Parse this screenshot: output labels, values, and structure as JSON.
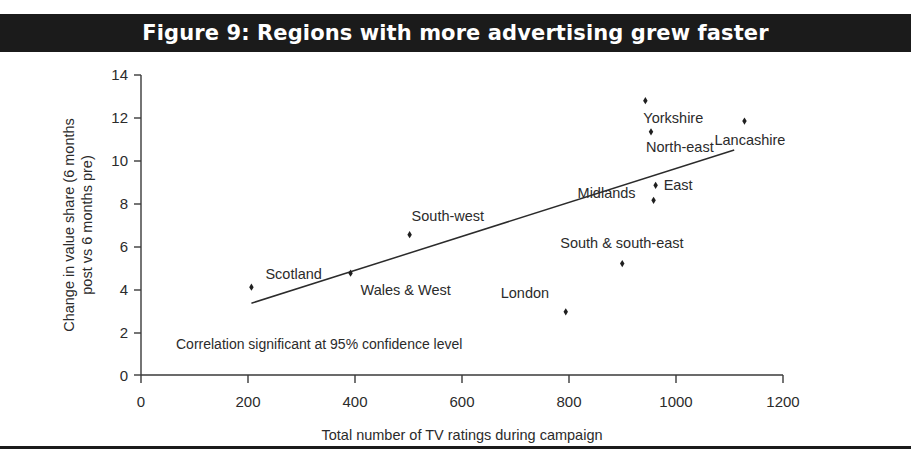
{
  "figure": {
    "title": "Figure 9: Regions with more advertising grew faster",
    "banner_color": "#1b1b1b",
    "banner_text_color": "#ffffff"
  },
  "chart_data": {
    "type": "scatter",
    "title": "Figure 9: Regions with more advertising grew faster",
    "xlabel": "Total number of TV ratings during campaign",
    "ylabel": "Change in value share (6 months post vs 6 months pre)",
    "ylabel_line1": "Change in value share (6 months",
    "ylabel_line2": "post vs 6 months pre)",
    "xlim": [
      0,
      1250
    ],
    "ylim": [
      0,
      14
    ],
    "xticks": [
      0,
      200,
      400,
      600,
      800,
      1000,
      1200
    ],
    "yticks": [
      0,
      2,
      4,
      6,
      8,
      10,
      12,
      14
    ],
    "grid": false,
    "legend": "none",
    "marker_color": "#1f1f1f",
    "points": [
      {
        "label": "Scotland",
        "x": 215,
        "y": 4.1,
        "label_dx": 14,
        "label_dy": -8
      },
      {
        "label": "Wales & West",
        "x": 408,
        "y": 4.75,
        "label_dx": 10,
        "label_dy": 22
      },
      {
        "label": "South-west",
        "x": 523,
        "y": 6.55,
        "label_dx": 2,
        "label_dy": -14
      },
      {
        "label": "London",
        "x": 827,
        "y": 2.95,
        "label_dx": -65,
        "label_dy": -14
      },
      {
        "label": "South & south-east",
        "x": 937,
        "y": 5.2,
        "label_dx": -62,
        "label_dy": -16
      },
      {
        "label": "Midlands",
        "x": 998,
        "y": 8.15,
        "label_dx": -76,
        "label_dy": -2
      },
      {
        "label": "East",
        "x": 1002,
        "y": 8.85,
        "label_dx": 8,
        "label_dy": 5
      },
      {
        "label": "North-east",
        "x": 993,
        "y": 11.35,
        "label_dx": -5,
        "label_dy": 20
      },
      {
        "label": "Yorkshire",
        "x": 982,
        "y": 12.8,
        "label_dx": -2,
        "label_dy": 22
      },
      {
        "label": "Lancashire",
        "x": 1175,
        "y": 11.85,
        "label_dx": -30,
        "label_dy": 24
      }
    ],
    "trendline": {
      "x1": 215,
      "y1": 3.35,
      "x2": 1155,
      "y2": 10.5
    },
    "annotation": "Correlation significant at 95% confidence level"
  }
}
